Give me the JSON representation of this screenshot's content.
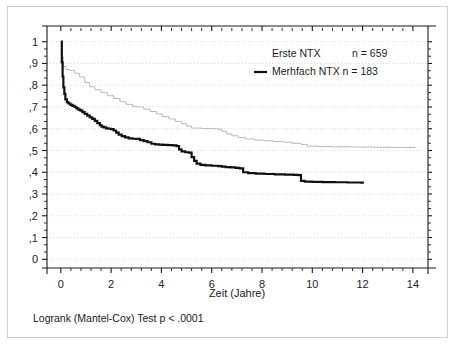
{
  "figure": {
    "caption": "Logrank (Mantel-Cox) Test p < .0001",
    "background": "#ffffff",
    "frame_color": "#c9d3de"
  },
  "legend": {
    "position": "top-right",
    "entries": [
      {
        "label": "Erste NTX",
        "count_label": "n = 659",
        "color": "#b9b9b9",
        "style": "thin-faint"
      },
      {
        "label": "Merhfach NTX n = 183",
        "count_label": "",
        "color": "#111111",
        "style": "thick-solid"
      }
    ]
  },
  "chart_data": {
    "type": "line",
    "title": "",
    "subtitle": "",
    "xlabel": "Zeit  (Jahre)",
    "ylabel": "",
    "xlim": [
      -0.55,
      14.6
    ],
    "ylim": [
      -0.04,
      1.04
    ],
    "xticks": [
      0,
      2,
      4,
      6,
      8,
      10,
      12,
      14
    ],
    "xticklabels": [
      "0",
      "2",
      "4",
      "6",
      "8",
      "10",
      "12",
      "14"
    ],
    "yticks": [
      0,
      0.1,
      0.2,
      0.3,
      0.4,
      0.5,
      0.6,
      0.7,
      0.8,
      0.9,
      1
    ],
    "yticklabels": [
      "0",
      ",1",
      ",2",
      ",3",
      ",4",
      ",5",
      ",6",
      ",7",
      ",8",
      ",9",
      "1"
    ],
    "minor_xticks_per_interval": 4,
    "minor_yticks_per_interval": 2,
    "grid": {
      "horizontal": true,
      "vertical": false,
      "color": "#cccccc",
      "style": "dotted"
    },
    "step_style": "post",
    "annotation": "Logrank (Mantel-Cox) Test p < .0001",
    "series": [
      {
        "name": "Erste NTX",
        "n": 659,
        "color": "#b9b9b9",
        "width": 1.0,
        "points": [
          [
            0.0,
            1.0
          ],
          [
            0.05,
            0.93
          ],
          [
            0.1,
            0.885
          ],
          [
            0.2,
            0.872
          ],
          [
            0.35,
            0.868
          ],
          [
            0.55,
            0.855
          ],
          [
            0.75,
            0.838
          ],
          [
            0.95,
            0.812
          ],
          [
            1.15,
            0.793
          ],
          [
            1.35,
            0.779
          ],
          [
            1.6,
            0.766
          ],
          [
            1.85,
            0.752
          ],
          [
            2.1,
            0.739
          ],
          [
            2.35,
            0.724
          ],
          [
            2.6,
            0.712
          ],
          [
            2.85,
            0.703
          ],
          [
            3.05,
            0.7
          ],
          [
            3.3,
            0.69
          ],
          [
            3.55,
            0.679
          ],
          [
            3.8,
            0.668
          ],
          [
            4.05,
            0.655
          ],
          [
            4.3,
            0.645
          ],
          [
            4.55,
            0.634
          ],
          [
            4.8,
            0.623
          ],
          [
            5.0,
            0.612
          ],
          [
            5.2,
            0.603
          ],
          [
            5.6,
            0.601
          ],
          [
            6.05,
            0.6
          ],
          [
            6.25,
            0.598
          ],
          [
            6.4,
            0.588
          ],
          [
            6.6,
            0.576
          ],
          [
            6.8,
            0.568
          ],
          [
            7.05,
            0.56
          ],
          [
            7.35,
            0.553
          ],
          [
            7.7,
            0.548
          ],
          [
            8.05,
            0.545
          ],
          [
            8.45,
            0.542
          ],
          [
            8.85,
            0.538
          ],
          [
            9.2,
            0.533
          ],
          [
            9.55,
            0.528
          ],
          [
            9.8,
            0.52
          ],
          [
            10.2,
            0.518
          ],
          [
            10.8,
            0.517
          ],
          [
            11.6,
            0.516
          ],
          [
            12.4,
            0.515
          ],
          [
            13.2,
            0.514
          ],
          [
            14.1,
            0.513
          ]
        ]
      },
      {
        "name": "Merhfach NTX",
        "n": 183,
        "color": "#111111",
        "width": 2.2,
        "points": [
          [
            0.0,
            1.0
          ],
          [
            0.04,
            0.905
          ],
          [
            0.07,
            0.84
          ],
          [
            0.1,
            0.79
          ],
          [
            0.14,
            0.76
          ],
          [
            0.18,
            0.735
          ],
          [
            0.24,
            0.722
          ],
          [
            0.3,
            0.716
          ],
          [
            0.38,
            0.71
          ],
          [
            0.46,
            0.705
          ],
          [
            0.55,
            0.7
          ],
          [
            0.62,
            0.694
          ],
          [
            0.7,
            0.688
          ],
          [
            0.78,
            0.683
          ],
          [
            0.86,
            0.676
          ],
          [
            0.95,
            0.668
          ],
          [
            1.05,
            0.66
          ],
          [
            1.15,
            0.652
          ],
          [
            1.25,
            0.645
          ],
          [
            1.35,
            0.636
          ],
          [
            1.45,
            0.626
          ],
          [
            1.55,
            0.617
          ],
          [
            1.62,
            0.61
          ],
          [
            1.7,
            0.606
          ],
          [
            1.8,
            0.602
          ],
          [
            1.9,
            0.6
          ],
          [
            2.0,
            0.598
          ],
          [
            2.1,
            0.592
          ],
          [
            2.2,
            0.582
          ],
          [
            2.3,
            0.573
          ],
          [
            2.42,
            0.566
          ],
          [
            2.55,
            0.56
          ],
          [
            2.7,
            0.556
          ],
          [
            2.85,
            0.554
          ],
          [
            3.0,
            0.553
          ],
          [
            3.15,
            0.548
          ],
          [
            3.3,
            0.543
          ],
          [
            3.45,
            0.538
          ],
          [
            3.6,
            0.531
          ],
          [
            3.75,
            0.528
          ],
          [
            3.9,
            0.527
          ],
          [
            4.05,
            0.526
          ],
          [
            4.25,
            0.525
          ],
          [
            4.45,
            0.524
          ],
          [
            4.6,
            0.52
          ],
          [
            4.7,
            0.505
          ],
          [
            4.8,
            0.496
          ],
          [
            4.95,
            0.492
          ],
          [
            5.1,
            0.49
          ],
          [
            5.2,
            0.47
          ],
          [
            5.3,
            0.452
          ],
          [
            5.4,
            0.44
          ],
          [
            5.55,
            0.434
          ],
          [
            5.75,
            0.432
          ],
          [
            6.0,
            0.43
          ],
          [
            6.25,
            0.428
          ],
          [
            6.4,
            0.426
          ],
          [
            6.55,
            0.424
          ],
          [
            6.75,
            0.422
          ],
          [
            6.95,
            0.42
          ],
          [
            7.1,
            0.418
          ],
          [
            7.25,
            0.4
          ],
          [
            7.45,
            0.396
          ],
          [
            7.75,
            0.394
          ],
          [
            8.1,
            0.392
          ],
          [
            8.5,
            0.39
          ],
          [
            8.9,
            0.389
          ],
          [
            9.25,
            0.388
          ],
          [
            9.45,
            0.387
          ],
          [
            9.55,
            0.36
          ],
          [
            9.7,
            0.357
          ],
          [
            10.0,
            0.356
          ],
          [
            10.4,
            0.355
          ],
          [
            10.9,
            0.354
          ],
          [
            11.4,
            0.353
          ],
          [
            11.95,
            0.352
          ],
          [
            12.05,
            0.352
          ]
        ]
      }
    ]
  },
  "axes": {
    "x_title": "Zeit  (Jahre)",
    "y_title": ""
  }
}
